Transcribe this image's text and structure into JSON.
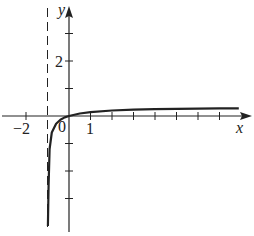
{
  "chart_data": {
    "type": "line",
    "title": "",
    "xlabel": "x",
    "ylabel": "y",
    "xlim": [
      -3,
      8.3
    ],
    "ylim": [
      -4,
      4
    ],
    "x_ticks": [
      -2,
      -1,
      0,
      1,
      2,
      3,
      4,
      5,
      6,
      7
    ],
    "y_ticks": [
      -3,
      -2,
      -1,
      1,
      2,
      3
    ],
    "tick_labels": {
      "x": [
        "-2",
        "0",
        "1"
      ],
      "y": [
        "2"
      ]
    },
    "vertical_asymptote": {
      "x": -1,
      "style": "dashed"
    },
    "horizontal_asymptote_approx": 0.3,
    "grid": false,
    "series": [
      {
        "name": "f(x)",
        "points": [
          [
            -0.98,
            -4.0
          ],
          [
            -0.95,
            -2.5
          ],
          [
            -0.9,
            -1.2
          ],
          [
            -0.8,
            -0.6
          ],
          [
            -0.6,
            -0.28
          ],
          [
            -0.4,
            -0.14
          ],
          [
            -0.2,
            -0.05
          ],
          [
            0,
            0
          ],
          [
            0.5,
            0.09
          ],
          [
            1,
            0.14
          ],
          [
            2,
            0.2
          ],
          [
            3,
            0.23
          ],
          [
            4,
            0.25
          ],
          [
            5,
            0.26
          ],
          [
            6,
            0.27
          ],
          [
            7,
            0.28
          ],
          [
            7.9,
            0.28
          ]
        ]
      }
    ]
  },
  "labels": {
    "x_axis": "x",
    "y_axis": "y",
    "tick_neg2": "−2",
    "tick_0": "0",
    "tick_1": "1",
    "tick_y2": "2"
  }
}
